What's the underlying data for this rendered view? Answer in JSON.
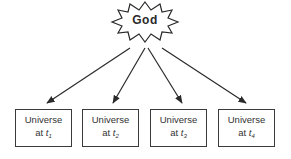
{
  "diagram": {
    "source_node": {
      "label": "God",
      "shape": "starburst"
    },
    "target_nodes": [
      {
        "line1": "Universe",
        "line2_prefix": "at ",
        "var": "t",
        "sub": "1"
      },
      {
        "line1": "Universe",
        "line2_prefix": "at ",
        "var": "t",
        "sub": "2"
      },
      {
        "line1": "Universe",
        "line2_prefix": "at ",
        "var": "t",
        "sub": "3"
      },
      {
        "line1": "Universe",
        "line2_prefix": "at ",
        "var": "t",
        "sub": "4"
      }
    ],
    "edges": [
      {
        "from": "God",
        "to": "Universe at t1"
      },
      {
        "from": "God",
        "to": "Universe at t2"
      },
      {
        "from": "God",
        "to": "Universe at t3"
      },
      {
        "from": "God",
        "to": "Universe at t4"
      }
    ],
    "colors": {
      "stroke": "#2a2a2a",
      "background": "#ffffff"
    }
  }
}
